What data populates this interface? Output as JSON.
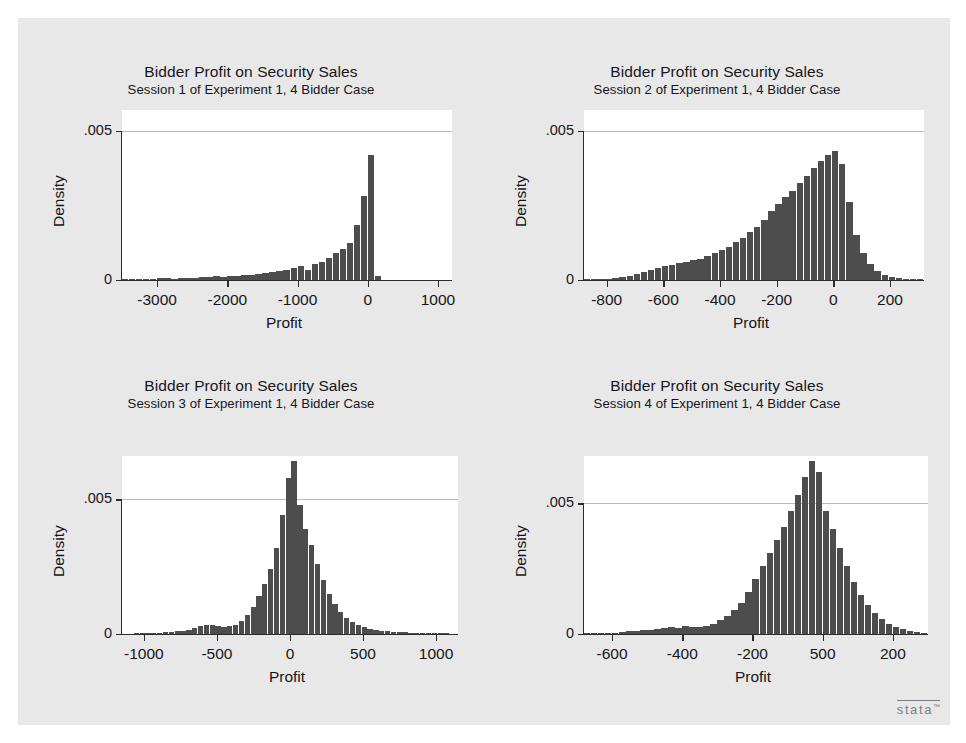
{
  "figure": {
    "background": "#e8e8e8",
    "plot_background": "#ffffff",
    "bar_color": "#4d4d4d",
    "logo": "stata",
    "logo_tm": "™"
  },
  "chart_data": [
    {
      "type": "bar",
      "title": "Bidder Profit on Security Sales",
      "subtitle": "Session 1 of Experiment 1, 4 Bidder Case",
      "xlabel": "Profit",
      "ylabel": "Density",
      "xlim": [
        -3500,
        1200
      ],
      "ylim": [
        0,
        0.0057
      ],
      "xticks": [
        -3000,
        -2000,
        -1000,
        0,
        1000
      ],
      "xtick_labels": [
        "-3000",
        "-2000",
        "-1000",
        "0",
        "1000"
      ],
      "yticks": [
        0,
        0.005
      ],
      "ytick_labels": [
        "0",
        ".005"
      ],
      "grid": true,
      "bin_width": 100,
      "bin_starts": [
        -3500,
        -3400,
        -3300,
        -3200,
        -3100,
        -3000,
        -2900,
        -2800,
        -2700,
        -2600,
        -2500,
        -2400,
        -2300,
        -2200,
        -2100,
        -2000,
        -1900,
        -1800,
        -1700,
        -1600,
        -1500,
        -1400,
        -1300,
        -1200,
        -1100,
        -1000,
        -900,
        -800,
        -700,
        -600,
        -500,
        -400,
        -300,
        -200,
        -100,
        0,
        100
      ],
      "values": [
        2e-05,
        2e-05,
        3e-05,
        3e-05,
        4e-05,
        8e-05,
        6e-05,
        5e-05,
        6e-05,
        8e-05,
        8e-05,
        9e-05,
        0.0001,
        0.00012,
        0.0001,
        0.00012,
        0.00014,
        0.00016,
        0.00018,
        0.0002,
        0.00022,
        0.00026,
        0.0003,
        0.00034,
        0.0004,
        0.00048,
        0.00035,
        0.00055,
        0.0006,
        0.00075,
        0.0009,
        0.00105,
        0.00125,
        0.00185,
        0.0028,
        0.0042,
        0.00012
      ]
    },
    {
      "type": "bar",
      "title": "Bidder Profit on Security Sales",
      "subtitle": "Session 2 of Experiment 1, 4 Bidder Case",
      "xlabel": "Profit",
      "ylabel": "Density",
      "xlim": [
        -880,
        320
      ],
      "ylim": [
        0,
        0.0057
      ],
      "xticks": [
        -800,
        -600,
        -400,
        -200,
        0,
        200
      ],
      "xtick_labels": [
        "-800",
        "-600",
        "-400",
        "-200",
        "0",
        "200"
      ],
      "yticks": [
        0,
        0.005
      ],
      "ytick_labels": [
        "0",
        ".005"
      ],
      "grid": true,
      "bin_width": 25,
      "bin_starts": [
        -880,
        -855,
        -830,
        -805,
        -780,
        -755,
        -730,
        -705,
        -680,
        -655,
        -630,
        -605,
        -580,
        -555,
        -530,
        -505,
        -480,
        -455,
        -430,
        -405,
        -380,
        -355,
        -330,
        -305,
        -280,
        -255,
        -230,
        -205,
        -180,
        -155,
        -130,
        -105,
        -80,
        -55,
        -30,
        -5,
        20,
        45,
        70,
        95,
        120,
        145,
        170,
        195,
        220,
        245,
        270,
        295
      ],
      "values": [
        2e-05,
        2e-05,
        3e-05,
        4e-05,
        6e-05,
        0.0001,
        0.00014,
        0.0002,
        0.00026,
        0.00034,
        0.0004,
        0.00046,
        0.0005,
        0.00056,
        0.0006,
        0.00066,
        0.00072,
        0.0008,
        0.0009,
        0.001,
        0.00112,
        0.00126,
        0.0014,
        0.0016,
        0.00178,
        0.002,
        0.0023,
        0.00256,
        0.00278,
        0.003,
        0.00324,
        0.0035,
        0.00376,
        0.004,
        0.00418,
        0.00432,
        0.0039,
        0.0026,
        0.0015,
        0.0009,
        0.00055,
        0.0003,
        0.00016,
        0.0001,
        6e-05,
        4e-05,
        3e-05,
        2e-05
      ]
    },
    {
      "type": "bar",
      "title": "Bidder Profit on Security Sales",
      "subtitle": "Session 3 of Experiment 1, 4 Bidder Case",
      "xlabel": "Profit",
      "ylabel": "Density",
      "xlim": [
        -1150,
        1150
      ],
      "ylim": [
        0,
        0.0066
      ],
      "xticks": [
        -1000,
        -500,
        0,
        500,
        1000
      ],
      "xtick_labels": [
        "-1000",
        "-500",
        "0",
        "500",
        "1000"
      ],
      "yticks": [
        0,
        0.005
      ],
      "ytick_labels": [
        "0",
        ".005"
      ],
      "grid": true,
      "bin_width": 40,
      "bin_starts": [
        -1150,
        -1110,
        -1070,
        -1030,
        -990,
        -950,
        -910,
        -870,
        -830,
        -790,
        -750,
        -710,
        -670,
        -630,
        -590,
        -550,
        -510,
        -470,
        -430,
        -390,
        -350,
        -310,
        -270,
        -230,
        -190,
        -150,
        -110,
        -70,
        -30,
        10,
        50,
        90,
        130,
        170,
        210,
        250,
        290,
        330,
        370,
        410,
        450,
        490,
        530,
        570,
        610,
        650,
        690,
        730,
        770,
        810,
        850,
        890,
        930,
        970,
        1010,
        1050,
        1090
      ],
      "values": [
        1e-05,
        1e-05,
        2e-05,
        2e-05,
        3e-05,
        4e-05,
        5e-05,
        6e-05,
        8e-05,
        0.0001,
        0.00012,
        0.00016,
        0.00022,
        0.0003,
        0.00032,
        0.00034,
        0.0003,
        0.00026,
        0.00028,
        0.00035,
        0.0005,
        0.0007,
        0.001,
        0.0014,
        0.00185,
        0.0024,
        0.0032,
        0.0044,
        0.0058,
        0.0064,
        0.0048,
        0.0039,
        0.0033,
        0.0026,
        0.002,
        0.0015,
        0.0011,
        0.0008,
        0.00058,
        0.00044,
        0.00034,
        0.00026,
        0.0002,
        0.00016,
        0.00012,
        0.0001,
        8e-05,
        7e-05,
        6e-05,
        5e-05,
        4e-05,
        4e-05,
        3e-05,
        3e-05,
        2e-05,
        2e-05,
        1e-05
      ]
    },
    {
      "type": "bar",
      "title": "Bidder Profit on Security Sales",
      "subtitle": "Session 4 of Experiment 1, 4 Bidder Case",
      "xlabel": "Profit",
      "ylabel": "Density",
      "xlim": [
        -680,
        300
      ],
      "ylim": [
        0,
        0.0068
      ],
      "xticks": [
        -600,
        -400,
        -200,
        0,
        200
      ],
      "xtick_labels": [
        "-600",
        "-400",
        "-200",
        "500",
        "200"
      ],
      "yticks": [
        0,
        0.005
      ],
      "ytick_labels": [
        "0",
        ".005"
      ],
      "grid": true,
      "bin_width": 20,
      "bin_starts": [
        -680,
        -660,
        -640,
        -620,
        -600,
        -580,
        -560,
        -540,
        -520,
        -500,
        -480,
        -460,
        -440,
        -420,
        -400,
        -380,
        -360,
        -340,
        -320,
        -300,
        -280,
        -260,
        -240,
        -220,
        -200,
        -180,
        -160,
        -140,
        -120,
        -100,
        -80,
        -60,
        -40,
        -20,
        0,
        20,
        40,
        60,
        80,
        100,
        120,
        140,
        160,
        180,
        200,
        220,
        240,
        260,
        280
      ],
      "values": [
        2e-05,
        2e-05,
        3e-05,
        4e-05,
        5e-05,
        8e-05,
        0.0001,
        0.00012,
        0.00014,
        0.00014,
        0.00018,
        0.00022,
        0.00026,
        0.00024,
        0.0003,
        0.00028,
        0.00026,
        0.00032,
        0.0004,
        0.00052,
        0.00068,
        0.0009,
        0.0012,
        0.0016,
        0.0021,
        0.0026,
        0.0031,
        0.0036,
        0.0041,
        0.0047,
        0.0053,
        0.006,
        0.0066,
        0.0062,
        0.0047,
        0.004,
        0.0033,
        0.0026,
        0.002,
        0.0015,
        0.0011,
        0.0008,
        0.00058,
        0.0004,
        0.00028,
        0.00018,
        0.00012,
        8e-05,
        5e-05
      ]
    }
  ]
}
